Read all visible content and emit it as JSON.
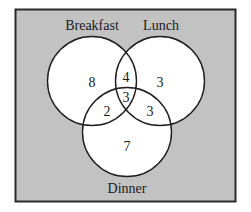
{
  "diagram": {
    "type": "venn",
    "background_color": "#c2c2c2",
    "border_color": "#2a2a2a",
    "circle_fill": "#ffffff",
    "circle_stroke": "#1f1f1f",
    "sets": [
      {
        "name": "Breakfast",
        "label": "Breakfast"
      },
      {
        "name": "Lunch",
        "label": "Lunch"
      },
      {
        "name": "Dinner",
        "label": "Dinner"
      }
    ],
    "regions": {
      "breakfast_only": "8",
      "lunch_only": "3",
      "dinner_only": "7",
      "breakfast_lunch_only": "4",
      "breakfast_dinner_only": "2",
      "lunch_dinner_only": "3",
      "all_three": "3"
    }
  }
}
